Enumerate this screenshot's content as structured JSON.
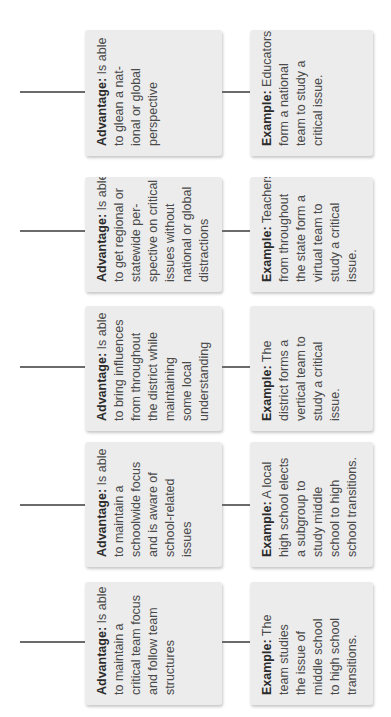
{
  "diagram": {
    "rows": [
      {
        "advantage": {
          "label": "Advantage:",
          "lines": [
            " Is able",
            "to glean a nat-",
            "ional or global",
            "perspective"
          ]
        },
        "example": {
          "label": "Example:",
          "lines": [
            " Educators",
            "form a national",
            "team to study a",
            "critical issue."
          ]
        }
      },
      {
        "advantage": {
          "label": "Advantage:",
          "lines": [
            " Is able",
            "to get regional or",
            "statewide per-",
            "spective on critical",
            "issues without",
            "national or global",
            "distractions"
          ]
        },
        "example": {
          "label": "Example:",
          "lines": [
            " Teachers",
            "from throughout",
            "the state form a",
            "virtual team to",
            "study a critical",
            "issue."
          ]
        }
      },
      {
        "advantage": {
          "label": "Advantage:",
          "lines": [
            " Is able",
            "to bring influences",
            "from throughout",
            "the district while",
            "maintaining",
            "some local",
            "understanding"
          ]
        },
        "example": {
          "label": "Example:",
          "lines": [
            " The",
            "district forms a",
            "vertical team to",
            "study a critical",
            "issue."
          ]
        }
      },
      {
        "advantage": {
          "label": "Advantage:",
          "lines": [
            " Is able",
            "to maintain a",
            "schoolwide focus",
            "and is aware of",
            "school-related",
            "issues"
          ]
        },
        "example": {
          "label": "Example:",
          "lines": [
            " A local",
            "high school elects",
            "a subgroup to",
            "study middle",
            "school to high",
            "school transitions."
          ]
        }
      },
      {
        "advantage": {
          "label": "Advantage:",
          "lines": [
            " Is able",
            "to maintain a",
            "critical team focus",
            "and follow team",
            "structures"
          ]
        },
        "example": {
          "label": "Example:",
          "lines": [
            " The",
            "team studies",
            "the issue of",
            "middle school",
            "to high school",
            "transitions."
          ]
        }
      }
    ]
  }
}
